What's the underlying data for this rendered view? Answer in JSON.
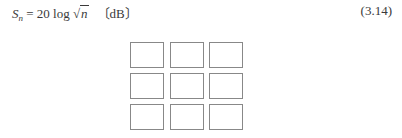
{
  "equation": {
    "lhs_var": "S",
    "lhs_sub": "n",
    "equals": " = ",
    "coefficient": "20",
    "function": " log ",
    "sqrt_symbol": "√",
    "radicand": "n",
    "unit": "〔dB〕",
    "number": "(3.14)"
  },
  "figure": {
    "type": "grid",
    "rows": 3,
    "cols": 3,
    "cells": [
      "",
      "",
      "",
      "",
      "",
      "",
      "",
      "",
      ""
    ],
    "border_color": "#888888"
  }
}
